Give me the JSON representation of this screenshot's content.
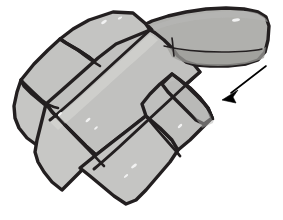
{
  "figure": {
    "background_color": "#ffffff",
    "outline_color": "#231f20",
    "canvas": {
      "width": 283,
      "height": 220
    }
  },
  "palette": {
    "outline": "#231f20",
    "stone_light": "#c9c9c7",
    "stone_mid": "#bcbcba",
    "stone_dark": "#a9a9a6",
    "stone_shadow": "#9a9a97",
    "highlight": "#e6e6e4",
    "arrow": "#000000",
    "background": "#ffffff"
  },
  "stones": [
    {
      "id": "stone-top-left",
      "label": "Top left slab",
      "fill": "#c4c4c2",
      "outline_width": 3.4,
      "path": "M 113 12 L 133 13 L 146 24 L 150 30 L 132 46 L 114 59 L 100 66 L 90 58 L 78 50 L 66 43 L 60 39 L 73 29 L 89 20 Z"
    },
    {
      "id": "stone-left-middle",
      "label": "Left middle slab",
      "fill": "#c3c3c1",
      "outline_width": 3.4,
      "path": "M 60 39 L 66 43 L 78 50 L 90 58 L 100 66 L 84 82 L 70 96 L 58 108 L 44 104 L 32 94 L 24 86 L 21 80 L 34 64 L 48 50 Z"
    },
    {
      "id": "stone-left-lower",
      "label": "Left lower slab",
      "fill": "#c6c6c4",
      "outline_width": 3.4,
      "path": "M 21 80 L 24 86 L 32 94 L 44 104 L 58 108 L 52 120 L 44 134 L 38 146 L 27 138 L 19 128 L 15 118 L 14 106 L 17 92 Z"
    },
    {
      "id": "stone-center-long",
      "label": "Central long slab",
      "fill": "#c1c1bf",
      "outline_width": 3.4,
      "path": "M 150 30 L 165 38 L 180 50 L 192 62 L 200 72 L 186 84 L 168 98 L 148 114 L 128 130 L 110 144 L 96 155 L 86 146 L 74 134 L 62 122 L 52 112 L 46 104 L 62 90 L 80 74 L 98 58 L 116 44 Z"
    },
    {
      "id": "stone-bottom-left",
      "label": "Bottom left slab",
      "fill": "#c7c7c5",
      "outline_width": 3.4,
      "path": "M 46 104 L 52 112 L 62 122 L 74 134 L 86 146 L 96 155 L 84 168 L 72 180 L 62 190 L 52 182 L 44 172 L 38 162 L 35 152 L 37 140 L 41 124 Z"
    },
    {
      "id": "stone-bottom-right",
      "label": "Bottom right slab",
      "fill": "#c5c5c3",
      "outline_width": 3.4,
      "path": "M 96 155 L 110 144 L 128 130 L 146 116 L 160 128 L 172 140 L 178 150 L 170 162 L 158 176 L 146 190 L 136 200 L 126 204 L 114 196 L 102 186 L 90 176 L 80 168 Z"
    },
    {
      "id": "stone-right-block",
      "label": "Right block slab",
      "fill": "#bfbfbd",
      "outline_width": 3.4,
      "path": "M 146 116 L 160 128 L 172 140 L 178 150 L 190 140 L 202 128 L 212 118 L 208 108 L 200 98 L 190 88 L 180 80 L 172 74 L 160 84 L 150 94 L 142 104 Z"
    },
    {
      "id": "stone-right-upper",
      "label": "Right upper slab",
      "fill": "#bebebc",
      "outline_width": 3.4,
      "path": "M 172 74 L 180 80 L 190 88 L 200 98 L 208 108 L 212 118 L 204 124 L 196 120 L 186 110 L 176 100 L 168 92 L 162 84 Z"
    },
    {
      "id": "stone-upper-arm",
      "label": "Upper right arm slab",
      "fill": "#b0b0ad",
      "outline_width": 3.4,
      "path": "M 146 24 L 152 21 L 168 16 L 186 12 L 206 9 L 226 8 L 244 9 L 258 12 L 266 17 L 269 26 L 268 40 L 265 52 L 258 60 L 246 64 L 228 66 L 210 66 L 196 65 L 186 62 L 178 56 L 172 48 L 164 40 L 154 32 Z"
    }
  ],
  "joints": [
    {
      "id": "joint-top-left-to-left-middle",
      "label": "Joint between top-left and left-middle slab",
      "width": 2.6,
      "path": "M 60 39 C 66 44, 74 47, 80 52 C 86 57, 92 61, 100 66"
    },
    {
      "id": "joint-left-middle-to-left-lower",
      "label": "Joint between left-middle and left-lower slab",
      "width": 2.6,
      "path": "M 21 80 C 27 86, 34 93, 42 100 C 48 105, 52 107, 58 108"
    },
    {
      "id": "joint-center-upper-edge",
      "label": "Upper edge of central long slab",
      "width": 3.0,
      "path": "M 150 30 C 140 39, 128 50, 116 61 C 104 72, 92 83, 80 94 C 70 103, 60 112, 50 120"
    },
    {
      "id": "joint-center-lower-edge",
      "label": "Lower edge of central long slab",
      "width": 3.0,
      "path": "M 200 72 C 188 83, 174 96, 160 109 C 146 122, 132 135, 118 148 C 108 157, 100 164, 94 169"
    },
    {
      "id": "joint-bottom-left-to-bottom-right",
      "label": "Joint between bottom-left and bottom-right slab",
      "width": 2.6,
      "path": "M 46 104 C 56 116, 68 129, 80 141 C 90 151, 98 160, 104 166"
    },
    {
      "id": "joint-bottom-right-to-right-block",
      "label": "Joint between bottom-right and right block",
      "width": 2.8,
      "path": "M 146 116 C 152 124, 160 133, 168 142 C 174 149, 178 153, 180 156"
    },
    {
      "id": "joint-arm-underside-crease",
      "label": "Crease along underside of upper arm",
      "width": 1.4,
      "path": "M 164 46 C 180 50, 200 52, 222 52 C 240 52, 254 51, 262 49"
    },
    {
      "id": "joint-arm-short-crack",
      "label": "Short crack on upper arm",
      "width": 1.6,
      "path": "M 172 38 C 173 44, 173 50, 174 56"
    },
    {
      "id": "joint-right-block-top",
      "label": "Top edge joint of right block",
      "width": 2.6,
      "path": "M 172 74 C 182 82, 194 93, 204 104 C 209 110, 212 115, 213 119"
    }
  ],
  "arrow": {
    "id": "direction-arrow",
    "label": "Direction arrow pointing down-left",
    "color": "#000000",
    "shaft_path": "M 266 66 L 231 93",
    "head_path": "M 222 100 L 238 90 L 233 97 L 236 103 Z",
    "tail_point": [
      266,
      66
    ],
    "tip_point": [
      222,
      100
    ]
  },
  "specks": [
    {
      "id": "speck-1",
      "cx": 104,
      "cy": 22,
      "rx": 3.2,
      "ry": 1.4,
      "rot": -32
    },
    {
      "id": "speck-2",
      "cx": 120,
      "cy": 18,
      "rx": 2.4,
      "ry": 1.1,
      "rot": -28
    },
    {
      "id": "speck-3",
      "cx": 88,
      "cy": 120,
      "rx": 3.0,
      "ry": 1.3,
      "rot": -40
    },
    {
      "id": "speck-4",
      "cx": 96,
      "cy": 128,
      "rx": 2.2,
      "ry": 1.0,
      "rot": -40
    },
    {
      "id": "speck-5",
      "cx": 134,
      "cy": 166,
      "rx": 3.4,
      "ry": 1.4,
      "rot": -38
    },
    {
      "id": "speck-6",
      "cx": 126,
      "cy": 176,
      "rx": 2.6,
      "ry": 1.1,
      "rot": -38
    },
    {
      "id": "speck-7",
      "cx": 236,
      "cy": 20,
      "rx": 4.0,
      "ry": 1.6,
      "rot": -6
    },
    {
      "id": "speck-8",
      "cx": 60,
      "cy": 114,
      "rx": 2.6,
      "ry": 1.2,
      "rot": -44
    },
    {
      "id": "speck-9",
      "cx": 180,
      "cy": 126,
      "rx": 2.8,
      "ry": 1.2,
      "rot": -42
    }
  ],
  "shadings": [
    {
      "id": "shade-arm-lower",
      "label": "Shaded underside of upper arm",
      "fill": "#9d9d9a",
      "opacity": 0.75,
      "path": "M 166 46 C 186 52, 212 54, 236 53 C 252 52, 262 50, 266 47 L 264 58 C 254 63, 238 66, 218 66 C 198 66, 182 63, 172 57 Z"
    },
    {
      "id": "shade-arm-upper",
      "label": "Upper shading band of arm",
      "fill": "#b8b8b5",
      "opacity": 0.6,
      "path": "M 152 26 C 176 16, 214 10, 246 11 C 258 12, 266 16, 268 22 C 252 17, 224 16, 196 20 C 176 23, 162 27, 154 31 Z"
    },
    {
      "id": "shade-center-left-highlight",
      "label": "Highlight along central slab",
      "fill": "#d8d8d6",
      "opacity": 0.55,
      "path": "M 150 34 C 134 48, 110 70, 86 92 C 68 108, 56 118, 50 122 L 58 130 C 70 120, 92 100, 116 78 C 136 60, 152 46, 158 40 Z"
    },
    {
      "id": "shade-right-block",
      "label": "Shading on right block",
      "fill": "#b4b4b1",
      "opacity": 0.5,
      "path": "M 176 80 C 188 90, 200 102, 210 114 C 213 118, 214 121, 213 123 L 202 128 C 198 120, 188 108, 176 96 C 170 90, 166 86, 164 84 Z"
    }
  ]
}
